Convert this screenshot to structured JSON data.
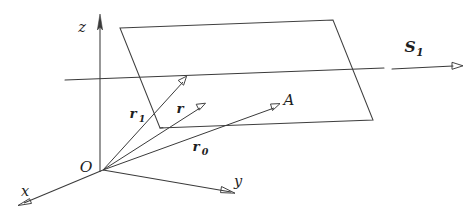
{
  "figure": {
    "type": "3d-vector-plane-diagram",
    "background_color": "#ffffff",
    "stroke_color": "#3a3a3a",
    "text_color": "#1e1e1e"
  },
  "axes": {
    "z": {
      "label": "z",
      "arrow": "up"
    },
    "x": {
      "label": "x",
      "arrow": "down-left"
    },
    "y": {
      "label": "y",
      "arrow": "down-right"
    }
  },
  "origin": {
    "label": "O"
  },
  "vectors": [
    {
      "name": "r1",
      "base": "r",
      "subscript": "1",
      "label": "r"
    },
    {
      "name": "r",
      "base": "r",
      "subscript": "",
      "label": "r"
    },
    {
      "name": "r0",
      "base": "r",
      "subscript": "0",
      "label": "r"
    }
  ],
  "vector_labels": {
    "r1_base": "r",
    "r1_sub": "1",
    "r_base": "r",
    "r0_base": "r",
    "r0_sub": "0"
  },
  "points": {
    "A": {
      "label": "A"
    }
  },
  "surface": {
    "name": "plane-S1",
    "label_base": "S",
    "label_sub": "1"
  },
  "lines": {
    "intersection_line": "horizontal-intersection-line"
  }
}
